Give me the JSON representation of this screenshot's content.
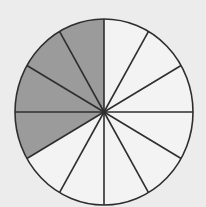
{
  "diagram": {
    "type": "fraction-circle",
    "total_sectors": 12,
    "shaded_sectors": 4,
    "shaded_sector_indices": [
      9,
      10,
      11,
      12
    ],
    "fraction_shaded": "4/12",
    "center": [
      104,
      112
    ],
    "radius_x": 89,
    "radius_y": 93,
    "start_angle_deg": -90,
    "colors": {
      "background": "#ececec",
      "unshaded_fill": "#f3f3f3",
      "shaded_fill": "#9b9b9b",
      "stroke": "#2e2e2e"
    }
  }
}
